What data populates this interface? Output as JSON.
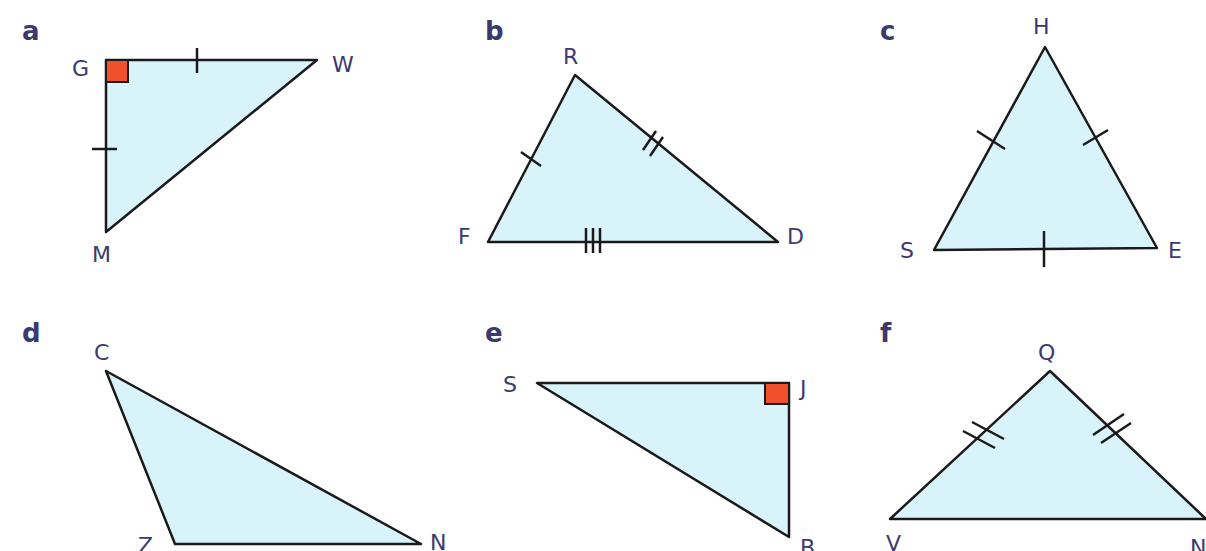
{
  "figure": {
    "panels": [
      {
        "id": "a",
        "label": "a",
        "vertices": [
          "G",
          "W",
          "M"
        ],
        "right_angle_at": "G",
        "equal_sides": [
          [
            "GW",
            "GM"
          ]
        ],
        "type": "right isosceles"
      },
      {
        "id": "b",
        "label": "b",
        "vertices": [
          "R",
          "D",
          "F"
        ],
        "right_angle_at": null,
        "tick_marks": {
          "FR": 1,
          "RD": 2,
          "FD": 3
        },
        "type": "scalene"
      },
      {
        "id": "c",
        "label": "c",
        "vertices": [
          "H",
          "S",
          "E"
        ],
        "right_angle_at": null,
        "tick_marks": {
          "SH": 1,
          "HE": 1,
          "SE": 1
        },
        "type": "equilateral"
      },
      {
        "id": "d",
        "label": "d",
        "vertices": [
          "C",
          "Z",
          "N"
        ],
        "right_angle_at": null,
        "tick_marks": {},
        "type": "obtuse scalene"
      },
      {
        "id": "e",
        "label": "e",
        "vertices": [
          "S",
          "J",
          "B"
        ],
        "right_angle_at": "J",
        "tick_marks": {},
        "type": "right scalene"
      },
      {
        "id": "f",
        "label": "f",
        "vertices": [
          "Q",
          "V",
          "N"
        ],
        "right_angle_at": null,
        "tick_marks": {
          "VQ": 2,
          "QN": 2
        },
        "type": "isosceles"
      }
    ],
    "labels": {
      "a": {
        "panel": "a",
        "G": "G",
        "W": "W",
        "M": "M"
      },
      "b": {
        "panel": "b",
        "R": "R",
        "F": "F",
        "D": "D"
      },
      "c": {
        "panel": "c",
        "H": "H",
        "S": "S",
        "E": "E"
      },
      "d": {
        "panel": "d",
        "C": "C",
        "Z": "Z",
        "N": "N"
      },
      "e": {
        "panel": "e",
        "S": "S",
        "J": "J",
        "B": "B"
      },
      "f": {
        "panel": "f",
        "Q": "Q",
        "V": "V",
        "N": "N"
      }
    },
    "colors": {
      "fill": "#d9f3fa",
      "stroke": "#1a1a1a",
      "right_angle": "#f0502a",
      "text": "#3b3a6e"
    }
  }
}
